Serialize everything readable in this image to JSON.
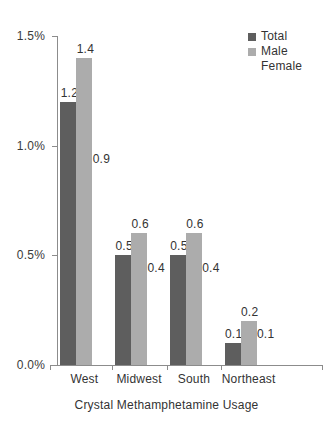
{
  "chart_data": {
    "type": "bar",
    "title": "",
    "xlabel": "Crystal Methamphetamine Usage",
    "ylabel": "",
    "categories": [
      "West",
      "Midwest",
      "South",
      "Northeast"
    ],
    "series": [
      {
        "name": "Total",
        "color": "#5e5e5e",
        "values": [
          1.2,
          0.5,
          0.5,
          0.1
        ]
      },
      {
        "name": "Male",
        "color": "#acacac",
        "values": [
          1.4,
          0.6,
          0.6,
          0.2
        ]
      },
      {
        "name": "Female",
        "color": "#ffffff",
        "values": [
          0.9,
          0.4,
          0.4,
          0.1
        ]
      }
    ],
    "value_labels": [
      [
        "1.2",
        "1.4",
        "0.9"
      ],
      [
        "0.5",
        "0.6",
        "0.4"
      ],
      [
        "0.5",
        "0.6",
        "0.4"
      ],
      [
        "0.1",
        "0.2",
        "0.1"
      ]
    ],
    "ylim": [
      0.0,
      1.5
    ],
    "yticks": [
      0.0,
      0.5,
      1.0,
      1.5
    ],
    "ytick_labels": [
      "0.0%",
      "0.5%",
      "1.0%",
      "1.5%"
    ],
    "grid": false,
    "legend_position": "top-right",
    "units": "percent"
  },
  "legend": {
    "items": [
      {
        "label": "Total",
        "swatch": "#5e5e5e"
      },
      {
        "label": "Male",
        "swatch": "#acacac"
      },
      {
        "label": "Female",
        "swatch": "#ffffff"
      }
    ]
  },
  "axis": {
    "x_title": "Crystal Methamphetamine Usage"
  }
}
